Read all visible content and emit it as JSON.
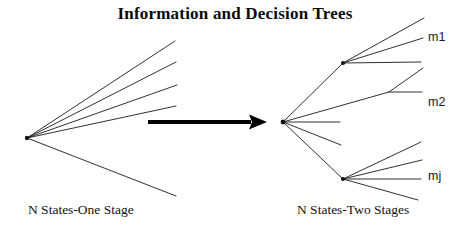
{
  "title": "Information and Decision Trees",
  "captions": {
    "left": "N States-One Stage",
    "right": "N States-Two Stages"
  },
  "leaf_labels": {
    "m1": "m1",
    "m2": "m2",
    "mj": "mj"
  },
  "colors": {
    "background": "#ffffff",
    "ink": "#111111",
    "line": "#1a1a1a",
    "arrow": "#000000"
  },
  "diagram": {
    "type": "decision-tree-diagram",
    "left_tree": {
      "name": "one-stage-tree",
      "root": {
        "x": 27,
        "y": 138
      },
      "branch_count": 5,
      "branches": [
        {
          "x": 175,
          "y": 41
        },
        {
          "x": 176,
          "y": 62
        },
        {
          "x": 177,
          "y": 85
        },
        {
          "x": 176,
          "y": 106
        },
        {
          "x": 176,
          "y": 196
        }
      ]
    },
    "arrow": {
      "name": "transform-arrow",
      "x1": 148,
      "y1": 122,
      "x2": 267,
      "y2": 122,
      "shaft_width": 4,
      "head_length": 18,
      "head_width": 15
    },
    "right_tree": {
      "name": "two-stage-tree",
      "root": {
        "x": 283,
        "y": 122
      },
      "stage1": [
        {
          "id": "node-upper",
          "x": 343,
          "y": 63
        },
        {
          "id": "stub-a",
          "x": 389,
          "y": 92
        },
        {
          "id": "stub-b",
          "x": 340,
          "y": 122
        },
        {
          "id": "stub-c",
          "x": 341,
          "y": 145
        },
        {
          "id": "node-lower",
          "x": 343,
          "y": 179
        }
      ],
      "upper_leaves": [
        {
          "x": 424,
          "y": 18
        },
        {
          "x": 423,
          "y": 38
        },
        {
          "x": 421,
          "y": 62
        }
      ],
      "middle_leaves": [
        {
          "x": 423,
          "y": 68
        },
        {
          "x": 422,
          "y": 92
        }
      ],
      "lower_leaves": [
        {
          "x": 421,
          "y": 142
        },
        {
          "x": 422,
          "y": 160
        },
        {
          "x": 421,
          "y": 179
        },
        {
          "x": 418,
          "y": 200
        }
      ]
    }
  }
}
